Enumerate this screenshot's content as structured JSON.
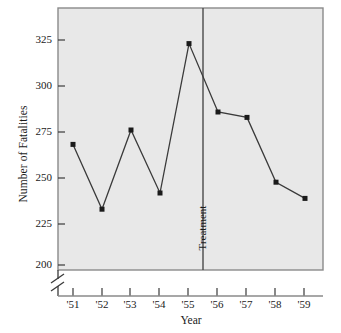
{
  "chart_data": {
    "type": "line",
    "title": "",
    "xlabel": "Year",
    "ylabel": "Number of Fatalities",
    "categories": [
      "'51",
      "'52",
      "'53",
      "'54",
      "'55",
      "'56",
      "'57",
      "'58",
      "'59"
    ],
    "values": [
      267,
      231,
      275,
      240,
      323,
      285,
      282,
      246,
      237
    ],
    "series": [
      {
        "name": "Number of Fatalities",
        "values": [
          267,
          231,
          275,
          240,
          323,
          285,
          282,
          246,
          237
        ]
      }
    ],
    "ylim": [
      195,
      335
    ],
    "yticks": [
      200,
      225,
      250,
      275,
      300,
      325
    ],
    "ytick_labels": [
      "200",
      "225",
      "250",
      "275",
      "300",
      "325"
    ],
    "xtick_labels": [
      "'51",
      "'52",
      "'53",
      "'54",
      "'55",
      "'56",
      "'57",
      "'58",
      "'59"
    ],
    "grid": false,
    "legend": false,
    "axis_break": true,
    "axis_break_axis": "y",
    "annotations": [
      {
        "type": "vline",
        "label": "Treatment",
        "x_between": [
          "'55",
          "'56"
        ],
        "orientation": "vertical"
      }
    ],
    "marker": "square",
    "line_color": "#3a3a3a",
    "marker_color": "#1a1a1a",
    "plot_background": "#e8e8e8"
  },
  "axes": {
    "y_title": "Number of Fatalities",
    "x_title": "Year"
  },
  "annotation": {
    "treatment": "Treatment"
  },
  "colors": {
    "line": "#3a3a3a",
    "marker": "#1a1a1a",
    "frame": "#8a8a8a",
    "plot_bg": "#e8e8e8",
    "page_bg": "#ffffff",
    "text": "#1a1a1a"
  }
}
